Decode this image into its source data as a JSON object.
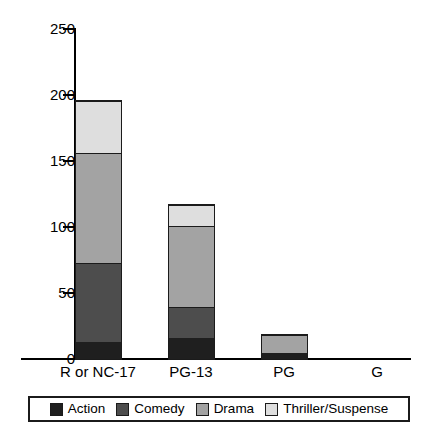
{
  "chart_data": {
    "type": "bar",
    "subtype": "stacked-bar",
    "title": "",
    "xlabel": "",
    "ylabel": "",
    "categories": [
      "R or NC-17",
      "PG-13",
      "PG",
      "G"
    ],
    "series": [
      {
        "name": "Action",
        "values": [
          13,
          16,
          5,
          0
        ],
        "color": "#1f1f1f"
      },
      {
        "name": "Comedy",
        "values": [
          60,
          24,
          0,
          0
        ],
        "color": "#4d4d4d"
      },
      {
        "name": "Drama",
        "values": [
          84,
          62,
          15,
          0
        ],
        "color": "#a3a3a3"
      },
      {
        "name": "Thriller/Suspense",
        "values": [
          40,
          16,
          0,
          0
        ],
        "color": "#dedede"
      }
    ],
    "totals": [
      197,
      118,
      20,
      0
    ],
    "ylim": [
      0,
      250
    ],
    "yticks": [
      0,
      50,
      100,
      150,
      200,
      250
    ],
    "ytick_labels": [
      "0",
      "50",
      "100",
      "150",
      "200",
      "250"
    ],
    "grid": false,
    "legend_position": "bottom",
    "legend_entries": [
      "Action",
      "Comedy",
      "Drama",
      "Thriller/Suspense"
    ]
  },
  "axis": {
    "y_tick_labels": [
      "250",
      "200",
      "150",
      "100",
      "50",
      "0"
    ]
  },
  "legend": {
    "items": [
      {
        "label": "Action"
      },
      {
        "label": "Comedy"
      },
      {
        "label": "Drama"
      },
      {
        "label": "Thriller/Suspense"
      }
    ]
  },
  "colors": {
    "action": "#1f1f1f",
    "comedy": "#4d4d4d",
    "drama": "#a3a3a3",
    "thriller": "#dedede",
    "axis": "#000000",
    "outline": "#1b1b1b",
    "background": "#ffffff"
  }
}
